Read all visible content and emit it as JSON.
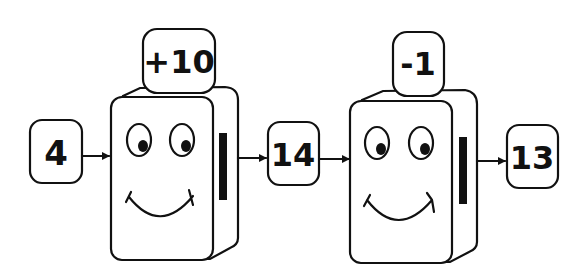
{
  "diagram": {
    "type": "function-machine-chain",
    "input": {
      "value": "4"
    },
    "machines": [
      {
        "operation": "+10",
        "output": "14"
      },
      {
        "operation": "-1",
        "output": "13"
      }
    ],
    "colors": {
      "stroke": "#111111",
      "background": "#ffffff"
    }
  }
}
